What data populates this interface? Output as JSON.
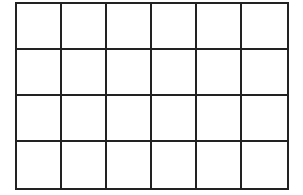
{
  "grid": {
    "rows": 4,
    "columns": 6,
    "line_color": "#222222",
    "background_color": "#ffffff",
    "cells": [
      [
        "",
        "",
        "",
        "",
        "",
        ""
      ],
      [
        "",
        "",
        "",
        "",
        "",
        ""
      ],
      [
        "",
        "",
        "",
        "",
        "",
        ""
      ],
      [
        "",
        "",
        "",
        "",
        "",
        ""
      ]
    ]
  }
}
